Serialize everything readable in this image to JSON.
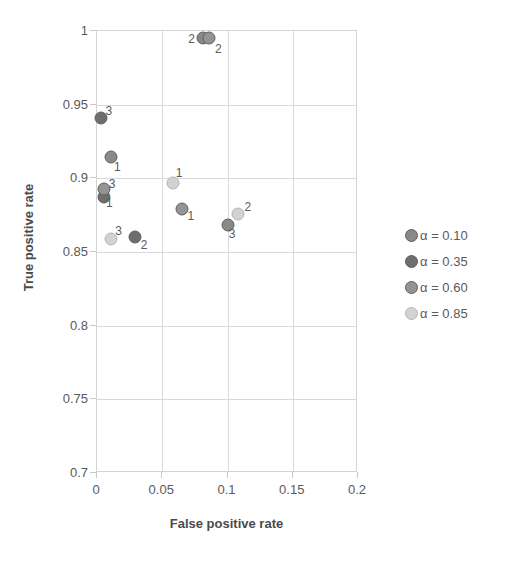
{
  "chart_data": {
    "type": "scatter",
    "title": "",
    "xlabel": "False positive rate",
    "ylabel": "True positive rate",
    "xlim": [
      0,
      0.2
    ],
    "ylim": [
      0.7,
      1
    ],
    "xticks": [
      "0",
      "0.05",
      "0.1",
      "0.15",
      "0.2"
    ],
    "xtick_values": [
      0,
      0.05,
      0.1,
      0.15,
      0.2
    ],
    "yticks": [
      "0.7",
      "0.75",
      "0.8",
      "0.85",
      "0.9",
      "0.95",
      "1"
    ],
    "ytick_values": [
      0.7,
      0.75,
      0.8,
      0.85,
      0.9,
      0.95,
      1
    ],
    "grid": true,
    "legend_position": "right",
    "series": [
      {
        "name": "α = 0.10",
        "color": "#898989",
        "points": [
          {
            "x": 0.0105,
            "y": 0.9145,
            "label": "1"
          },
          {
            "x": 0.0815,
            "y": 0.9955,
            "label": "2"
          },
          {
            "x": 0.1005,
            "y": 0.8685,
            "label": "3"
          }
        ]
      },
      {
        "name": "α = 0.35",
        "color": "#6e6e6e",
        "points": [
          {
            "x": 0.0055,
            "y": 0.8875,
            "label": "1"
          },
          {
            "x": 0.0295,
            "y": 0.86,
            "label": "2"
          },
          {
            "x": 0.003,
            "y": 0.941,
            "label": "3"
          }
        ]
      },
      {
        "name": "α = 0.60",
        "color": "#949494",
        "points": [
          {
            "x": 0.0655,
            "y": 0.8795,
            "label": "1"
          },
          {
            "x": 0.0855,
            "y": 0.995,
            "label": "2"
          },
          {
            "x": 0.005,
            "y": 0.893,
            "label": "3"
          }
        ]
      },
      {
        "name": "α = 0.85",
        "color": "#d2d2d2",
        "points": [
          {
            "x": 0.0585,
            "y": 0.897,
            "label": "1"
          },
          {
            "x": 0.108,
            "y": 0.8755,
            "label": "2"
          },
          {
            "x": 0.011,
            "y": 0.859,
            "label": "3"
          }
        ]
      }
    ],
    "point_labels": [
      {
        "x": 0.0155,
        "y": 0.9075,
        "text": "1"
      },
      {
        "x": 0.0095,
        "y": 0.8835,
        "text": "1"
      },
      {
        "x": 0.072,
        "y": 0.8745,
        "text": "1"
      },
      {
        "x": 0.063,
        "y": 0.9035,
        "text": "1"
      },
      {
        "x": 0.036,
        "y": 0.8545,
        "text": "2"
      },
      {
        "x": 0.0725,
        "y": 0.9945,
        "text": "2"
      },
      {
        "x": 0.093,
        "y": 0.988,
        "text": "2"
      },
      {
        "x": 0.1155,
        "y": 0.8805,
        "text": "2"
      },
      {
        "x": 0.009,
        "y": 0.946,
        "text": "3"
      },
      {
        "x": 0.0115,
        "y": 0.896,
        "text": "3"
      },
      {
        "x": 0.0165,
        "y": 0.8645,
        "text": "3"
      },
      {
        "x": 0.1035,
        "y": 0.862,
        "text": "3"
      }
    ]
  },
  "legend": {
    "items": [
      {
        "label": "α = 0.10",
        "color": "#898989"
      },
      {
        "label": "α = 0.35",
        "color": "#6e6e6e"
      },
      {
        "label": "α = 0.60",
        "color": "#949494"
      },
      {
        "label": "α = 0.85",
        "color": "#d2d2d2"
      }
    ]
  }
}
